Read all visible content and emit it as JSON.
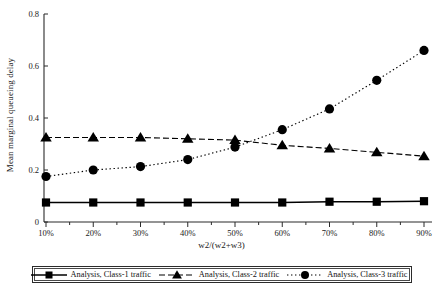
{
  "chart_data": {
    "type": "line",
    "title": "",
    "subtitle": "",
    "xlabel": "w2/(w2+w3)",
    "ylabel": "Mean marginal queueing delay",
    "categories": [
      "10%",
      "20%",
      "30%",
      "40%",
      "50%",
      "60%",
      "70%",
      "80%",
      "90%"
    ],
    "x_values": [
      10,
      20,
      30,
      40,
      50,
      60,
      70,
      80,
      90
    ],
    "xlim": [
      10,
      90
    ],
    "ylim": [
      0,
      0.8
    ],
    "y_ticks": [
      "0",
      "0.2",
      "0.4",
      "0.6",
      "0.8"
    ],
    "y_tick_values": [
      0,
      0.2,
      0.4,
      0.6,
      0.8
    ],
    "grid": false,
    "legend_position": "bottom",
    "series": [
      {
        "name": "Analysis, Class-1 traffic",
        "marker": "square",
        "line_style": "solid",
        "color": "#000000",
        "values": [
          0.075,
          0.075,
          0.075,
          0.075,
          0.075,
          0.075,
          0.078,
          0.078,
          0.08
        ]
      },
      {
        "name": "Analysis, Class-2 traffic",
        "marker": "triangle",
        "line_style": "dashed",
        "color": "#000000",
        "values": [
          0.325,
          0.325,
          0.325,
          0.32,
          0.315,
          0.295,
          0.283,
          0.268,
          0.253
        ]
      },
      {
        "name": "Analysis, Class-3 traffic",
        "marker": "circle",
        "line_style": "dotted",
        "color": "#000000",
        "values": [
          0.175,
          0.2,
          0.213,
          0.24,
          0.288,
          0.355,
          0.435,
          0.545,
          0.66
        ]
      }
    ]
  },
  "legend": {
    "items": [
      {
        "label": "Analysis, Class-1 traffic",
        "marker": "square",
        "line_style": "solid"
      },
      {
        "label": "Analysis, Class-2 traffic",
        "marker": "triangle",
        "line_style": "dashed"
      },
      {
        "label": "Analysis, Class-3 traffic",
        "marker": "circle",
        "line_style": "dotted"
      }
    ]
  },
  "axes": {
    "y_title": "Mean marginal queueing delay",
    "x_title": "w2/(w2+w3)"
  }
}
